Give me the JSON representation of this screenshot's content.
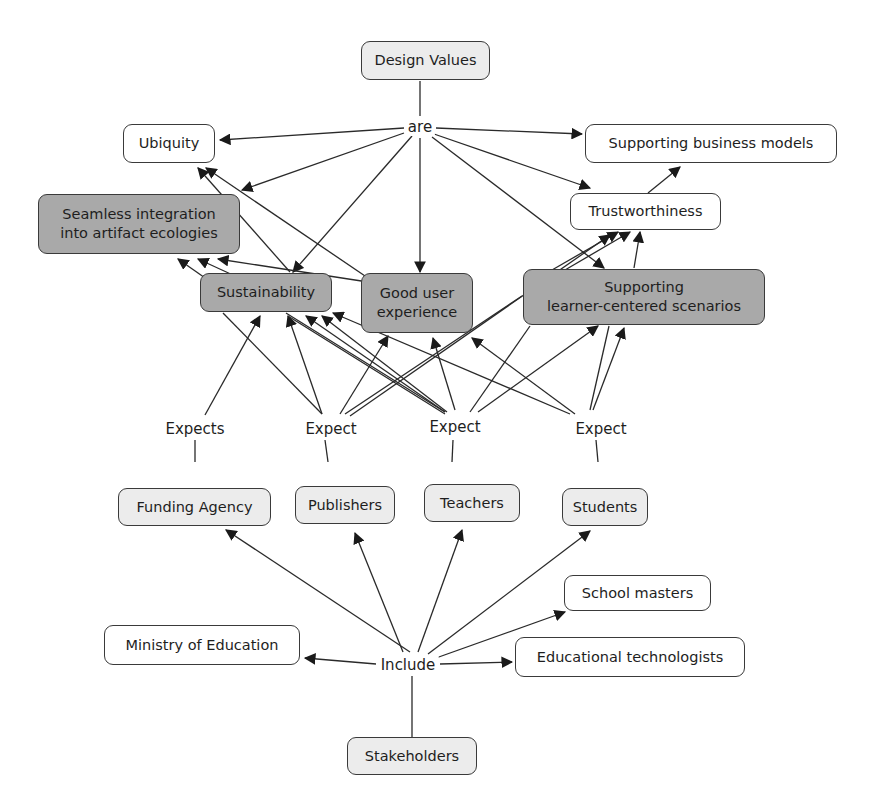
{
  "diagram": {
    "nodes": {
      "design_values": "Design Values",
      "ubiquity": "Ubiquity",
      "supporting_business_models": "Supporting business models",
      "trustworthiness": "Trustworthiness",
      "seamless_integration_line1": "Seamless integration",
      "seamless_integration_line2": "into artifact ecologies",
      "sustainability": "Sustainability",
      "good_ux_line1": "Good user",
      "good_ux_line2": "experience",
      "learner_centered_line1": "Supporting",
      "learner_centered_line2": "learner-centered scenarios",
      "funding_agency": "Funding Agency",
      "publishers": "Publishers",
      "teachers": "Teachers",
      "students": "Students",
      "school_masters": "School masters",
      "ministry_of_education": "Ministry of Education",
      "educational_technologists": "Educational technologists",
      "stakeholders": "Stakeholders"
    },
    "link_labels": {
      "are": "are",
      "expects_funding": "Expects",
      "expect_publishers": "Expect",
      "expect_teachers": "Expect",
      "expect_students": "Expect",
      "include": "Include"
    },
    "colors": {
      "line": "#2a2a2a",
      "node_white": "#ffffff",
      "node_light": "#ececec",
      "node_dark": "#a9a9a9",
      "border": "#3a3a3a"
    }
  }
}
